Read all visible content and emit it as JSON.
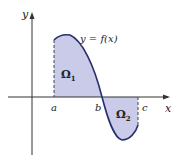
{
  "diagram": {
    "axis_labels": {
      "x": "x",
      "y": "y"
    },
    "points": {
      "a": "a",
      "b": "b",
      "c": "c"
    },
    "curve_label": "y = f(x)",
    "regions": {
      "omega1": "Ω",
      "omega1_sub": "1",
      "omega2": "Ω",
      "omega2_sub": "2"
    },
    "colors": {
      "fill": "#c9cbe8",
      "curve": "#2a2f6e",
      "axis": "#333333"
    }
  }
}
